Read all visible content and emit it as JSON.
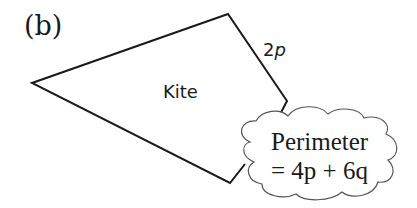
{
  "part_label": "(b)",
  "shape_label": "Kite",
  "side_label": {
    "coef": "2",
    "var": "p"
  },
  "cloud": {
    "line1": "Perimeter",
    "line2": "= 4p + 6q"
  },
  "colors": {
    "stroke": "#1a1a1a",
    "background": "#ffffff"
  }
}
